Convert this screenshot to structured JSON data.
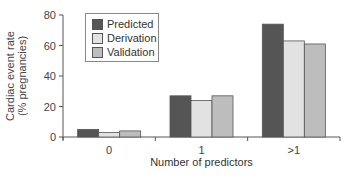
{
  "chart_data": {
    "type": "bar",
    "title": "",
    "xlabel": "Number of predictors",
    "ylabel": "Cardiac event rate (% pregnancies)",
    "ylabel_lines": [
      "Cardiac event rate",
      "(% pregnancies)"
    ],
    "ylim": [
      0,
      80
    ],
    "yticks": [
      0,
      20,
      40,
      60,
      80
    ],
    "categories": [
      "0",
      "1",
      ">1"
    ],
    "series": [
      {
        "name": "Predicted",
        "color": "#555555",
        "values": [
          5,
          27,
          74
        ]
      },
      {
        "name": "Derivation",
        "color": "#e2e2e2",
        "values": [
          3,
          24,
          63
        ]
      },
      {
        "name": "Validation",
        "color": "#bdbdbd",
        "values": [
          4,
          27,
          61
        ]
      }
    ],
    "grid": false,
    "legend_position": "upper-left"
  }
}
